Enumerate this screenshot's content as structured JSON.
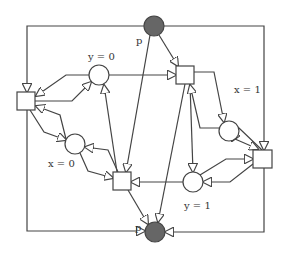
{
  "diagram": {
    "type": "petri-net",
    "places": [
      {
        "id": "p_top",
        "label": "p",
        "cx": 154,
        "cy": 26,
        "r": 10,
        "marked": true,
        "lx": 136,
        "ly": 44
      },
      {
        "id": "p_bot",
        "label": "p",
        "cx": 155,
        "cy": 232,
        "r": 10,
        "marked": true,
        "lx": 135,
        "ly": 231
      },
      {
        "id": "y0",
        "label": "y = 0",
        "cx": 99,
        "cy": 75,
        "r": 10,
        "marked": false,
        "lx": 88,
        "ly": 60
      },
      {
        "id": "x0",
        "label": "x = 0",
        "cx": 75,
        "cy": 144,
        "r": 10,
        "marked": false,
        "lx": 48,
        "ly": 167
      },
      {
        "id": "x1",
        "label": "x = 1",
        "cx": 229,
        "cy": 131,
        "r": 10,
        "marked": false,
        "lx": 234,
        "ly": 93
      },
      {
        "id": "y1",
        "label": "y = 1",
        "cx": 193,
        "cy": 182,
        "r": 10,
        "marked": false,
        "lx": 184,
        "ly": 209
      }
    ],
    "transitions": [
      {
        "id": "t_left",
        "x": 17,
        "y": 92,
        "w": 18,
        "h": 18
      },
      {
        "id": "t_topright",
        "x": 176,
        "y": 66,
        "w": 18,
        "h": 18
      },
      {
        "id": "t_right",
        "x": 253,
        "y": 150,
        "w": 19,
        "h": 18
      },
      {
        "id": "t_botmid",
        "x": 113,
        "y": 172,
        "w": 18,
        "h": 18
      }
    ],
    "arcs": [
      {
        "from": "p_top",
        "to": "t_left",
        "points": [
          [
            144,
            26
          ],
          [
            27,
            26
          ],
          [
            27,
            92
          ]
        ]
      },
      {
        "from": "p_top",
        "to": "t_right",
        "points": [
          [
            164,
            26
          ],
          [
            264,
            26
          ],
          [
            264,
            150
          ]
        ]
      },
      {
        "from": "p_top",
        "to": "t_topright",
        "points": [
          [
            159,
            35
          ],
          [
            178,
            66
          ]
        ]
      },
      {
        "from": "p_top",
        "to": "t_botmid",
        "points": [
          [
            150,
            35
          ],
          [
            126,
            172
          ]
        ]
      },
      {
        "from": "t_left",
        "to": "p_bot",
        "points": [
          [
            27,
            110
          ],
          [
            27,
            231
          ],
          [
            145,
            231
          ]
        ]
      },
      {
        "from": "t_right",
        "to": "p_bot",
        "points": [
          [
            264,
            168
          ],
          [
            264,
            232
          ],
          [
            165,
            232
          ]
        ]
      },
      {
        "from": "t_botmid",
        "to": "p_bot",
        "points": [
          [
            128,
            190
          ],
          [
            148,
            224
          ]
        ]
      },
      {
        "from": "t_topright",
        "to": "p_bot",
        "points": [
          [
            185,
            84
          ],
          [
            158,
            222
          ]
        ]
      },
      {
        "from": "y0",
        "to": "t_left",
        "points": [
          [
            89,
            75
          ],
          [
            66,
            75
          ],
          [
            36,
            96
          ]
        ]
      },
      {
        "from": "t_left",
        "to": "y0",
        "points": [
          [
            35,
            101
          ],
          [
            72,
            101
          ],
          [
            91,
            82
          ]
        ]
      },
      {
        "from": "y0",
        "to": "t_topright",
        "points": [
          [
            109,
            75
          ],
          [
            176,
            75
          ]
        ]
      },
      {
        "from": "t_botmid",
        "to": "y0",
        "points": [
          [
            117,
            172
          ],
          [
            104,
            85
          ]
        ]
      },
      {
        "from": "x0",
        "to": "t_left",
        "points": [
          [
            66,
            139
          ],
          [
            60,
            115
          ],
          [
            36,
            106
          ]
        ]
      },
      {
        "from": "t_left",
        "to": "x0",
        "points": [
          [
            30,
            110
          ],
          [
            44,
            132
          ],
          [
            66,
            140
          ]
        ]
      },
      {
        "from": "t_botmid",
        "to": "x0",
        "points": [
          [
            118,
            172
          ],
          [
            108,
            150
          ],
          [
            85,
            147
          ]
        ]
      },
      {
        "from": "x0",
        "to": "t_botmid",
        "points": [
          [
            80,
            153
          ],
          [
            88,
            171
          ],
          [
            113,
            178
          ]
        ]
      },
      {
        "from": "y1",
        "to": "t_botmid",
        "points": [
          [
            183,
            182
          ],
          [
            131,
            182
          ]
        ]
      },
      {
        "from": "t_topright",
        "to": "y1",
        "points": [
          [
            190,
            84
          ],
          [
            193,
            172
          ]
        ]
      },
      {
        "from": "t_topright",
        "to": "x1",
        "points": [
          [
            193,
            72
          ],
          [
            214,
            72
          ],
          [
            224,
            122
          ]
        ]
      },
      {
        "from": "x1",
        "to": "t_topright",
        "points": [
          [
            220,
            128
          ],
          [
            200,
            128
          ],
          [
            190,
            85
          ]
        ]
      },
      {
        "from": "x1",
        "to": "t_right",
        "points": [
          [
            235,
            139
          ],
          [
            258,
            149
          ]
        ]
      },
      {
        "from": "t_right",
        "to": "x1",
        "points": [
          [
            262,
            150
          ],
          [
            239,
            128
          ],
          [
            232,
            141
          ]
        ]
      },
      {
        "from": "y1",
        "to": "t_right",
        "points": [
          [
            200,
            175
          ],
          [
            226,
            159
          ],
          [
            253,
            159
          ]
        ]
      },
      {
        "from": "t_right",
        "to": "y1",
        "points": [
          [
            253,
            164
          ],
          [
            230,
            182
          ],
          [
            203,
            182
          ]
        ]
      }
    ]
  }
}
